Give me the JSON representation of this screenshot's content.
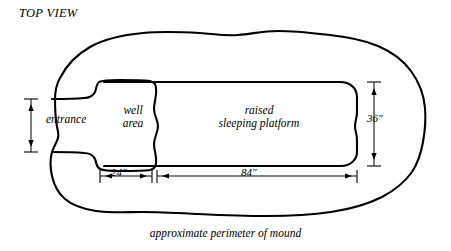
{
  "diagram": {
    "title": "TOP VIEW",
    "caption": "approximate perimeter of mound",
    "regions": {
      "entrance": "entrance",
      "well_area_line1": "well",
      "well_area_line2": "area",
      "platform_line1": "raised",
      "platform_line2": "sleeping platform"
    },
    "dimensions": {
      "well_width": "24\"",
      "platform_length": "84\"",
      "platform_width": "36\""
    },
    "colors": {
      "ink": "#000000",
      "background": "#ffffff"
    }
  }
}
